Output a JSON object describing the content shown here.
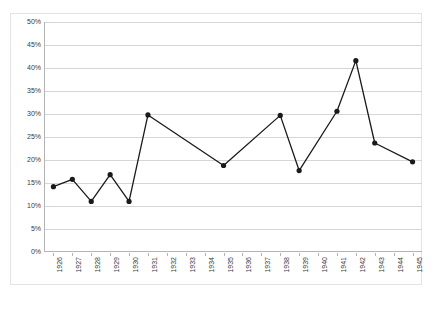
{
  "chart_data": {
    "type": "line",
    "title": "",
    "xlabel": "",
    "ylabel": "",
    "ylim": [
      0,
      50
    ],
    "y_tick_step": 5,
    "y_tick_suffix": "%",
    "grid": true,
    "legend": false,
    "legend_position": "none",
    "marker": "filled-circle",
    "line_color": "#1a1a1a",
    "marker_color": "#1a1a1a",
    "grid_color": "#d6d6d6",
    "axis_color": "#b4b4b4",
    "categories": [
      "1926",
      "1927",
      "1928",
      "1929",
      "1930",
      "1931",
      "1932",
      "1933",
      "1934",
      "1935",
      "1936",
      "1937",
      "1938",
      "1939",
      "1940",
      "1941",
      "1942",
      "1943",
      "1944",
      "1945"
    ],
    "y_tick_labels": [
      "50%",
      "45%",
      "40%",
      "35%",
      "30%",
      "25%",
      "20%",
      "15%",
      "10%",
      "5%",
      "0%"
    ],
    "y_tick_values": [
      50,
      45,
      40,
      35,
      30,
      25,
      20,
      15,
      10,
      5,
      0
    ],
    "values": [
      14.2,
      15.8,
      11.0,
      16.8,
      11.0,
      29.8,
      null,
      null,
      null,
      18.8,
      null,
      null,
      29.7,
      17.7,
      null,
      30.6,
      41.6,
      23.7,
      null,
      19.6
    ],
    "points": [
      {
        "x": "1926",
        "y": 14.2
      },
      {
        "x": "1927",
        "y": 15.8
      },
      {
        "x": "1928",
        "y": 11.0
      },
      {
        "x": "1929",
        "y": 16.8
      },
      {
        "x": "1930",
        "y": 11.0
      },
      {
        "x": "1931",
        "y": 29.8
      },
      {
        "x": "1935",
        "y": 18.8
      },
      {
        "x": "1938",
        "y": 29.7
      },
      {
        "x": "1939",
        "y": 17.7
      },
      {
        "x": "1941",
        "y": 30.6
      },
      {
        "x": "1942",
        "y": 41.6
      },
      {
        "x": "1943",
        "y": 23.7
      },
      {
        "x": "1945",
        "y": 19.6
      }
    ]
  }
}
